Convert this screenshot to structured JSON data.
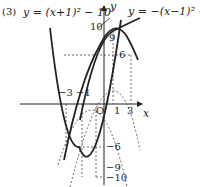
{
  "problem_number": "(3)",
  "equation_left": "y = (x+1)² − 10",
  "equation_right": "y = −(x−1)² + 10",
  "axes": {
    "x_label": "x",
    "y_label": "y",
    "origin_label": "O"
  },
  "x_ticks": [
    "−3",
    "−1",
    "1",
    "3"
  ],
  "y_ticks": {
    "top": "10",
    "top_inner": "9",
    "mid_pos": "6",
    "mid_neg": "−6",
    "low": "−9",
    "bottom": "−10"
  },
  "colors": {
    "curve": "#222222",
    "dashed": "#444444"
  }
}
